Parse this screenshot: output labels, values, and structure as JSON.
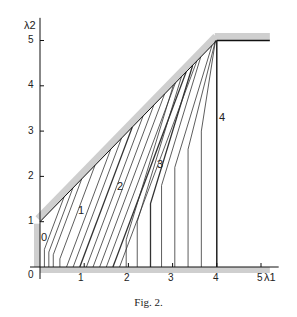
{
  "figure": {
    "caption": "Fig. 2.",
    "x_axis_label": "λ1",
    "y_axis_label": "λ2",
    "origin_label": "0",
    "x_ticks": [
      "1",
      "2",
      "3",
      "4",
      "5"
    ],
    "y_ticks": [
      "1",
      "2",
      "3",
      "4",
      "5"
    ],
    "region_labels": [
      "0",
      "1",
      "2",
      "3",
      "4"
    ]
  },
  "chart_data": {
    "type": "line",
    "title": "Fig. 2.",
    "xlabel": "λ1",
    "ylabel": "λ2",
    "xlim": [
      0,
      5.2
    ],
    "ylim": [
      0,
      5.3
    ],
    "grid": false,
    "boundary": [
      {
        "name": "left boundary (λ1=0)",
        "points": [
          [
            0,
            0
          ],
          [
            0,
            1
          ]
        ]
      },
      {
        "name": "diagonal boundary λ2=λ1+1",
        "points": [
          [
            0,
            1
          ],
          [
            4,
            5
          ]
        ]
      },
      {
        "name": "top boundary λ2=5",
        "points": [
          [
            4,
            5
          ],
          [
            5,
            5
          ]
        ]
      },
      {
        "name": "bottom boundary λ2=0",
        "points": [
          [
            0,
            0
          ],
          [
            5,
            0
          ]
        ]
      }
    ],
    "annotations": [
      {
        "text": "0",
        "x": 0.1,
        "y": 0.55
      },
      {
        "text": "1",
        "x": 0.95,
        "y": 1.55
      },
      {
        "text": "2",
        "x": 1.8,
        "y": 1.9
      },
      {
        "text": "3",
        "x": 2.75,
        "y": 1.85
      },
      {
        "text": "4",
        "x": 4.1,
        "y": 3.9
      }
    ],
    "vertical_line_at_4": {
      "points": [
        [
          4,
          0
        ],
        [
          4,
          5
        ]
      ]
    }
  }
}
